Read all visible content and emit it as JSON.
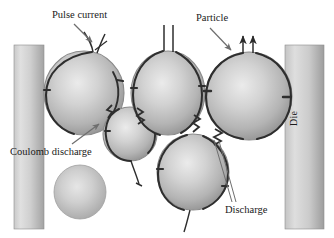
{
  "figure": {
    "background_color": "#ffffff"
  },
  "labels": {
    "pulse_current": "Pulse current",
    "particle": "Particle",
    "coulomb_discharge": "Coulomb discharge",
    "discharge": "Discharge",
    "die": "Die"
  },
  "colors": {
    "die_fill_light": "#d8d8d8",
    "die_fill_dark": "#9a9a9a",
    "particle_core": "#e2e2e2",
    "particle_mid": "#b9b9b9",
    "particle_edge": "#8f8f8f",
    "particle_ring": "#909090",
    "current_path": "#2b2b2b",
    "label_text": "#1a1a1a",
    "arrow": "#6e6e6e"
  },
  "dies": [
    {
      "name": "left-die",
      "x": 14,
      "y": 45,
      "width": 30,
      "height": 184
    },
    {
      "name": "right-die",
      "x": 285,
      "y": 45,
      "width": 39,
      "height": 184
    }
  ],
  "particles": [
    {
      "name": "particle-top-left",
      "cx": 84,
      "cy": 93,
      "rx": 40,
      "ry": 42,
      "has_current_ring": true
    },
    {
      "name": "particle-small-center",
      "cx": 130,
      "cy": 134,
      "rx": 27,
      "ry": 27,
      "has_current_ring": true
    },
    {
      "name": "particle-top-center",
      "cx": 168,
      "cy": 93,
      "rx": 37,
      "ry": 42,
      "has_current_ring": true
    },
    {
      "name": "particle-top-right",
      "cx": 249,
      "cy": 96,
      "rx": 43,
      "ry": 44,
      "has_current_ring": true
    },
    {
      "name": "particle-bottom-center",
      "cx": 193,
      "cy": 172,
      "rx": 36,
      "ry": 38,
      "has_current_ring": true
    },
    {
      "name": "particle-isolated",
      "cx": 80,
      "cy": 192,
      "rx": 26,
      "ry": 27,
      "has_current_ring": false
    }
  ],
  "discharges": [
    {
      "name": "discharge-arc-left-pair",
      "between": [
        "particle-top-left",
        "particle-small-center"
      ]
    },
    {
      "name": "discharge-arc-center-pair",
      "between": [
        "particle-small-center",
        "particle-top-center"
      ]
    },
    {
      "name": "discharge-arc-right-pair",
      "between": [
        "particle-top-center",
        "particle-bottom-center"
      ]
    },
    {
      "name": "discharge-arc-bottom-pair",
      "between": [
        "particle-bottom-center",
        "particle-top-right"
      ]
    }
  ],
  "current_leads": [
    {
      "name": "lead-pulse-current",
      "particle": "particle-top-left",
      "count": 2
    },
    {
      "name": "lead-vertical-pair",
      "particle": "particle-top-center",
      "count": 2
    },
    {
      "name": "lead-arrow-pair",
      "particle": "particle-top-right",
      "count": 2,
      "arrowheads": true
    },
    {
      "name": "lead-tail-small",
      "particle": "particle-small-center",
      "count": 1
    },
    {
      "name": "lead-tail-bottom",
      "particle": "particle-bottom-center",
      "count": 1
    }
  ]
}
